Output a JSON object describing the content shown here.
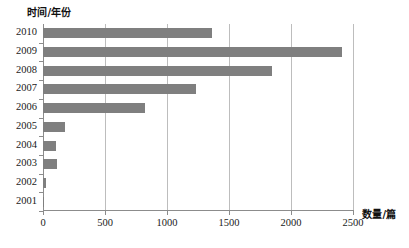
{
  "chart_data": {
    "type": "bar",
    "orientation": "horizontal",
    "title": "",
    "xlabel": "数量/篇",
    "ylabel": "时间/年份",
    "categories": [
      "2010",
      "2009",
      "2008",
      "2007",
      "2006",
      "2005",
      "2004",
      "2003",
      "2002",
      "2001"
    ],
    "values": [
      1360,
      2410,
      1850,
      1230,
      820,
      180,
      105,
      110,
      25,
      10
    ],
    "xlim": [
      0,
      2500
    ],
    "xticks": [
      0,
      500,
      1000,
      1500,
      2000,
      2500
    ],
    "xtick_labels": [
      "0",
      "500",
      "1000",
      "1500",
      "2000",
      "2500"
    ],
    "grid": true,
    "grid_axis": "x",
    "legend": false,
    "bar_color": "#7f7f7f",
    "axis_color": "#8c8c8c",
    "grid_color": "#bdbdbd",
    "background": "#ffffff"
  }
}
